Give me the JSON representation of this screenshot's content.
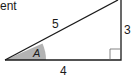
{
  "header": {
    "partial_text": "ent"
  },
  "diagram": {
    "type": "right-triangle",
    "hypotenuse_label": "5",
    "vertical_leg_label": "3",
    "base_label": "4",
    "angle_label": "A",
    "angle_fill": "#b3b3b3",
    "stroke_color": "#1a1a1a"
  }
}
